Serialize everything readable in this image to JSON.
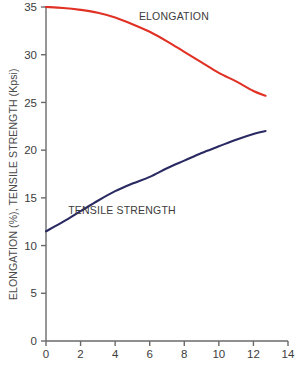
{
  "chart_data": {
    "type": "line",
    "title": "",
    "xlabel": "",
    "ylabel": "ELONGATION (%), TENSILE STRENGTH (Kpsi)",
    "xlim": [
      0,
      14
    ],
    "ylim": [
      0,
      35
    ],
    "grid": false,
    "legend_position": "inline-annotations",
    "x_ticks": [
      0,
      2,
      4,
      6,
      8,
      10,
      12,
      14
    ],
    "x_tick_labels": [
      "0",
      "2",
      "4",
      "6",
      "8",
      "10",
      "12",
      "14"
    ],
    "y_ticks": [
      0,
      5,
      10,
      15,
      20,
      25,
      30,
      35
    ],
    "y_tick_labels": [
      "0",
      "5",
      "10",
      "15",
      "20",
      "25",
      "30",
      "35"
    ],
    "series": [
      {
        "name": "ELONGATION",
        "color": "#e03124",
        "unit": "%",
        "x": [
          0,
          1,
          2,
          3,
          4,
          5,
          6,
          7,
          8,
          9,
          10,
          11,
          12,
          12.7
        ],
        "values": [
          35.0,
          34.9,
          34.7,
          34.4,
          33.9,
          33.2,
          32.4,
          31.4,
          30.3,
          29.2,
          28.1,
          27.2,
          26.2,
          25.7
        ]
      },
      {
        "name": "TENSILE STRENGTH",
        "color": "#2a2a63",
        "unit": "Kpsi",
        "x": [
          0,
          1,
          2,
          3,
          4,
          5,
          6,
          7,
          8,
          9,
          10,
          11,
          12,
          12.7
        ],
        "values": [
          11.5,
          12.5,
          13.6,
          14.7,
          15.7,
          16.5,
          17.2,
          18.1,
          18.9,
          19.7,
          20.4,
          21.1,
          21.7,
          22.0
        ]
      }
    ],
    "annotations": [
      {
        "text": "ELONGATION",
        "series": "ELONGATION",
        "x": 7.4,
        "y": 33.6
      },
      {
        "text": "TENSILE STRENGTH",
        "series": "TENSILE STRENGTH",
        "x": 4.4,
        "y": 13.3
      }
    ],
    "axis_color": "#6a6a6a"
  }
}
